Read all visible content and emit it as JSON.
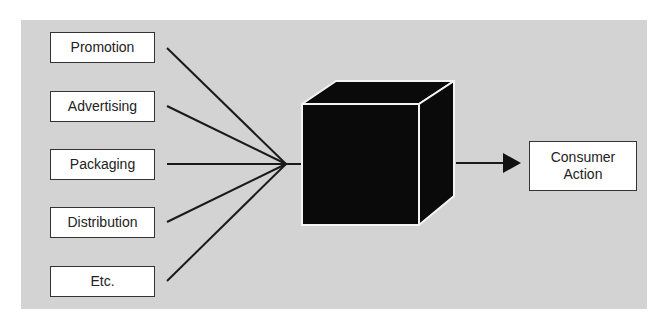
{
  "diagram": {
    "inputs": [
      {
        "label": "Promotion"
      },
      {
        "label": "Advertising"
      },
      {
        "label": "Packaging"
      },
      {
        "label": "Distribution"
      },
      {
        "label": "Etc."
      }
    ],
    "center": {
      "label": "black-box"
    },
    "output": {
      "line1": "Consumer",
      "line2": "Action"
    }
  },
  "colors": {
    "panel_background": "#d3d3d3",
    "box_fill": "#ffffff",
    "cube_fill": "#0a0a0a",
    "line": "#1a1a1a"
  }
}
